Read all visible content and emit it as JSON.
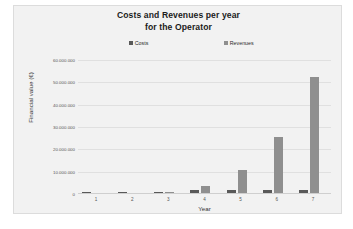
{
  "chart_data": {
    "type": "bar",
    "title": "Costs and Revenues per year for the Operator",
    "title_lines": [
      "Costs and Revenues per year",
      "for the Operator"
    ],
    "xlabel": "Year",
    "ylabel": "Financial value (€)",
    "categories": [
      "1",
      "2",
      "3",
      "4",
      "5",
      "6",
      "7"
    ],
    "series": [
      {
        "name": "Costs",
        "color": "#595959",
        "values": [
          100000,
          400000,
          500000,
          1200000,
          1400000,
          1500000,
          1500000
        ]
      },
      {
        "name": "Revenues",
        "color": "#8f8f8f",
        "values": [
          0,
          0,
          500000,
          3000000,
          10500000,
          25000000,
          52000000
        ]
      }
    ],
    "ylim": [
      0,
      60000000
    ],
    "ytick_values": [
      60000000,
      50000000,
      40000000,
      30000000,
      20000000,
      10000000,
      0
    ],
    "ytick_labels": [
      "60.000.000",
      "50.000.000",
      "40.000.000",
      "30.000.000",
      "20.000.000",
      "10.000.000",
      "0"
    ],
    "grid": true,
    "legend_position": "top"
  },
  "legend": {
    "costs_label": "Costs",
    "revenues_label": "Revenues"
  },
  "colors": {
    "costs": "#595959",
    "revenues": "#8f8f8f",
    "plot_background": "#f2f2f2",
    "gridline": "#e0e0e0",
    "border": "#dcdcdc"
  }
}
